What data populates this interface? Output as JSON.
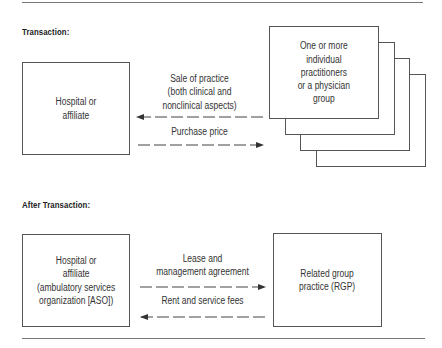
{
  "diagram": {
    "sections": [
      {
        "title": "Transaction:",
        "left_box": {
          "text": "Hospital or\naffiliate"
        },
        "right_box": {
          "text": "One or more\nindividual\npractitioners\nor a physician\ngroup",
          "stacked_count": 4
        },
        "arrows": [
          {
            "label": "Sale of practice\n(both clinical and\nnonclinical aspects)",
            "direction": "left",
            "style": "dashed"
          },
          {
            "label": "Purchase price",
            "direction": "right",
            "style": "dashed"
          }
        ]
      },
      {
        "title": "After Transaction:",
        "left_box": {
          "text": "Hospital or\naffiliate\n(ambulatory services\norganization [ASO])"
        },
        "right_box": {
          "text": "Related group\npractice (RGP)"
        },
        "arrows": [
          {
            "label": "Lease and\nmanagement agreement",
            "direction": "right",
            "style": "dashed"
          },
          {
            "label": "Rent and service fees",
            "direction": "left",
            "style": "dashed"
          }
        ]
      }
    ],
    "colors": {
      "line": "#555555",
      "rule": "#777777",
      "text": "#333333"
    }
  }
}
